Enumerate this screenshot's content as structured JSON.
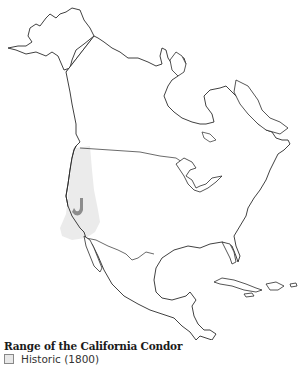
{
  "map": {
    "region": "North America",
    "colors": {
      "outline": "#2b2b2b",
      "land": "#ffffff",
      "historic_range": "#e8e8e8",
      "current_range": "#8c8c8c"
    }
  },
  "legend": {
    "title": "Range of the California Condor",
    "items": [
      {
        "label": "Historic (1800)",
        "color": "#e8e8e8"
      }
    ]
  }
}
